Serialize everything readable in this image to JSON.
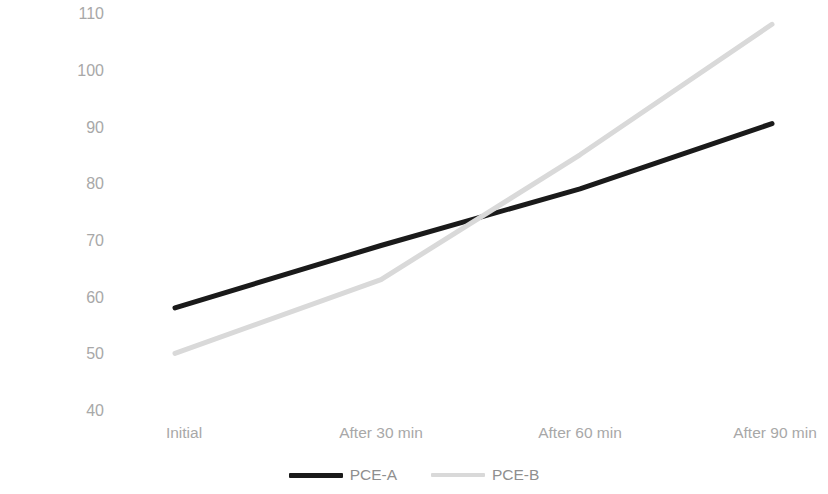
{
  "chart_data": {
    "type": "line",
    "title": "",
    "xlabel": "",
    "ylabel": "Flow time (seconds)",
    "categories": [
      "Initial",
      "After 30 min",
      "After 60 min",
      "After 90 min"
    ],
    "series": [
      {
        "name": "PCE-A",
        "values": [
          58,
          69,
          79,
          90.5
        ],
        "color": "#1a1a1a",
        "style": "solid"
      },
      {
        "name": "PCE-B",
        "values": [
          50,
          63,
          85,
          108
        ],
        "color": "#d9d9d9",
        "style": "solid"
      }
    ],
    "ylim": [
      40,
      110
    ],
    "yticks": [
      110,
      100,
      90,
      80,
      70,
      60,
      50,
      40
    ],
    "grid": false,
    "legend_position": "bottom"
  },
  "axes": {
    "y_label": "Flow time (seconds)",
    "y_ticks": [
      "110",
      "100",
      "90",
      "80",
      "70",
      "60",
      "50",
      "40"
    ],
    "x_ticks": [
      "Initial",
      "After 30 min",
      "After 60 min",
      "After 90 min"
    ]
  },
  "legend": {
    "items": [
      {
        "label": "PCE-A"
      },
      {
        "label": "PCE-B"
      }
    ]
  },
  "colors": {
    "series_a": "#1a1a1a",
    "series_b": "#d9d9d9",
    "tick_text": "#a8a8a8",
    "axis_text": "#8a8a8a",
    "background": "#ffffff"
  }
}
